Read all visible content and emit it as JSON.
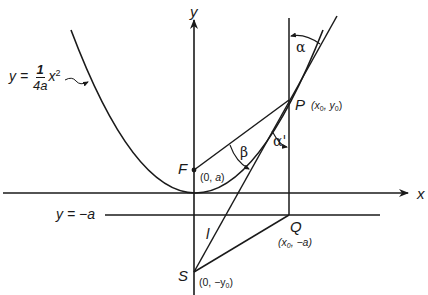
{
  "diagram": {
    "type": "geometry",
    "axes": {
      "x_label": "x",
      "y_label": "y"
    },
    "curve": {
      "label_lhs": "y = ",
      "label_num": "1",
      "label_den": "4a",
      "label_var": "x",
      "label_exp": "2"
    },
    "directrix": {
      "label": "y = −a"
    },
    "points": {
      "F": {
        "name": "F",
        "coords_prefix": "(0, ",
        "coords_var": "a",
        "coords_suffix": ")"
      },
      "P": {
        "name": "P",
        "coords_open": "(x",
        "coords_sub1": "0",
        "coords_mid": ", y",
        "coords_sub2": "0",
        "coords_close": ")"
      },
      "Q": {
        "name": "Q",
        "coords_open": "(x",
        "coords_sub1": "0",
        "coords_mid": ", −a)"
      },
      "S": {
        "name": "S",
        "coords_open": "(0, −y",
        "coords_sub1": "0",
        "coords_close": ")"
      }
    },
    "line_labels": {
      "l": "l"
    },
    "angles": {
      "alpha": "α",
      "alpha_prime": "α'",
      "beta": "β"
    },
    "colors": {
      "ink": "#1a1a1a",
      "background": "#ffffff"
    }
  }
}
